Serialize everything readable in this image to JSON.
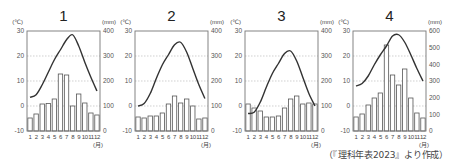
{
  "source_caption": "（『理科年表2023』より作成）",
  "chart_data": [
    {
      "type": "bar+line",
      "title": "1",
      "categories": [
        "1",
        "2",
        "3",
        "4",
        "5",
        "6",
        "7",
        "8",
        "9",
        "10",
        "11",
        "12"
      ],
      "x_unit": "(月)",
      "left_axis": {
        "label": "(℃)",
        "range": [
          -10,
          30
        ],
        "ticks": [
          -10,
          0,
          10,
          20,
          30
        ]
      },
      "right_axis": {
        "label": "(mm)",
        "range": [
          0,
          400
        ],
        "ticks": [
          0,
          100,
          200,
          300,
          400
        ]
      },
      "grid": true,
      "series": [
        {
          "name": "precipitation",
          "kind": "bar",
          "axis": "right",
          "values": [
            52,
            68,
            108,
            110,
            128,
            228,
            224,
            100,
            148,
            112,
            72,
            64
          ]
        },
        {
          "name": "temperature",
          "kind": "line",
          "axis": "left",
          "values": [
            3.5,
            4.5,
            8.5,
            13.5,
            18.5,
            22.5,
            26.5,
            28.5,
            24,
            17.5,
            11.5,
            6
          ]
        }
      ]
    },
    {
      "type": "bar+line",
      "title": "2",
      "categories": [
        "1",
        "2",
        "3",
        "4",
        "5",
        "6",
        "7",
        "8",
        "9",
        "10",
        "11",
        "12"
      ],
      "x_unit": "(月)",
      "left_axis": {
        "label": "(℃)",
        "range": [
          -10,
          30
        ],
        "ticks": [
          -10,
          0,
          10,
          20,
          30
        ]
      },
      "right_axis": {
        "label": "(mm)",
        "range": [
          0,
          400
        ],
        "ticks": [
          0,
          100,
          200,
          300,
          400
        ]
      },
      "grid": true,
      "series": [
        {
          "name": "precipitation",
          "kind": "bar",
          "axis": "right",
          "values": [
            56,
            52,
            60,
            60,
            72,
            108,
            140,
            112,
            128,
            100,
            48,
            52
          ]
        },
        {
          "name": "temperature",
          "kind": "line",
          "axis": "left",
          "values": [
            0,
            1,
            5,
            11,
            16.5,
            20.5,
            24.5,
            25.5,
            21.5,
            15,
            8.5,
            3
          ]
        }
      ]
    },
    {
      "type": "bar+line",
      "title": "3",
      "categories": [
        "1",
        "2",
        "3",
        "4",
        "5",
        "6",
        "7",
        "8",
        "9",
        "10",
        "11",
        "12"
      ],
      "x_unit": "(月)",
      "left_axis": {
        "label": "(℃)",
        "range": [
          -10,
          30
        ],
        "ticks": [
          -10,
          0,
          10,
          20,
          30
        ]
      },
      "right_axis": {
        "label": "(mm)",
        "range": [
          0,
          400
        ],
        "ticks": [
          0,
          100,
          200,
          300,
          400
        ]
      },
      "grid": true,
      "series": [
        {
          "name": "precipitation",
          "kind": "bar",
          "axis": "right",
          "values": [
            108,
            92,
            80,
            56,
            56,
            60,
            92,
            128,
            140,
            108,
            112,
            108
          ]
        },
        {
          "name": "temperature",
          "kind": "line",
          "axis": "left",
          "values": [
            -3,
            -2.5,
            1.5,
            7.5,
            13,
            17,
            21,
            22,
            18,
            11.5,
            5,
            0
          ]
        }
      ]
    },
    {
      "type": "bar+line",
      "title": "4",
      "categories": [
        "1",
        "2",
        "3",
        "4",
        "5",
        "6",
        "7",
        "8",
        "9",
        "10",
        "11",
        "12"
      ],
      "x_unit": "(月)",
      "left_axis": {
        "label": "(℃)",
        "range": [
          -10,
          30
        ],
        "ticks": [
          -10,
          0,
          10,
          20,
          30
        ]
      },
      "right_axis": {
        "label": "(mm)",
        "range": [
          0,
          600
        ],
        "ticks": [
          0,
          100,
          200,
          300,
          400,
          500,
          600
        ]
      },
      "grid": true,
      "series": [
        {
          "name": "precipitation",
          "kind": "bar",
          "axis": "right",
          "values": [
            84,
            102,
            156,
            198,
            228,
            516,
            336,
            276,
            372,
            198,
            108,
            78
          ]
        },
        {
          "name": "temperature",
          "kind": "line",
          "axis": "left",
          "values": [
            8,
            9,
            12,
            16.5,
            20.5,
            24,
            28,
            28.5,
            25.5,
            20.5,
            15,
            10
          ]
        }
      ]
    }
  ]
}
